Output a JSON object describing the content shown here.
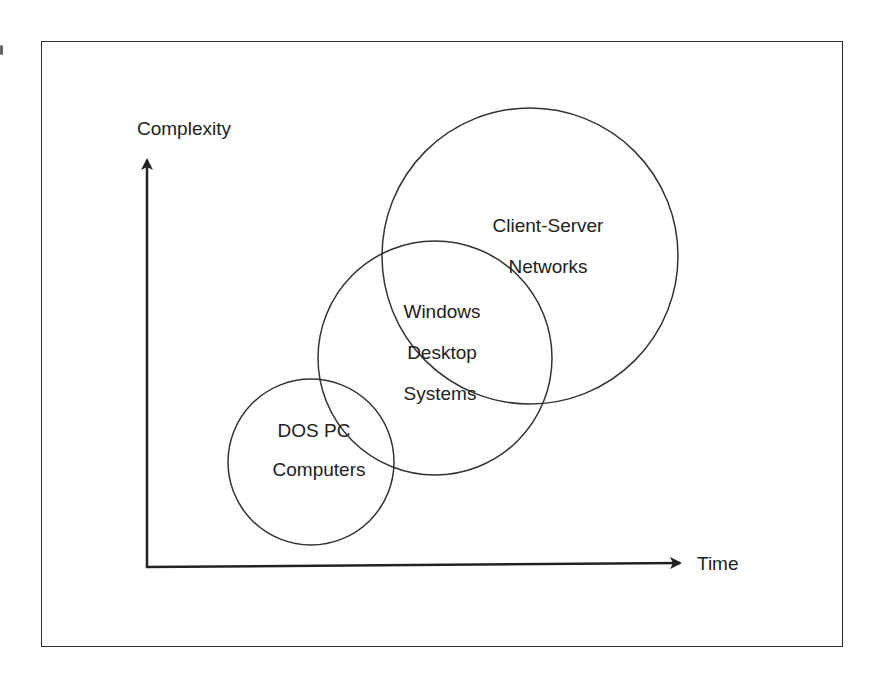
{
  "diagram": {
    "type": "venn-timeline",
    "axes": {
      "y_label": "Complexity",
      "x_label": "Time"
    },
    "circles": [
      {
        "id": "dos",
        "lines": [
          "DOS PC",
          "Computers"
        ],
        "cx": 311,
        "cy": 462,
        "r": 83
      },
      {
        "id": "windows",
        "lines": [
          "Windows",
          "Desktop",
          "Systems"
        ],
        "cx": 435,
        "cy": 358,
        "r": 117
      },
      {
        "id": "client-server",
        "lines": [
          "Client-Server",
          "Networks"
        ],
        "cx": 530,
        "cy": 256,
        "r": 148
      }
    ],
    "colors": {
      "stroke": "#333333",
      "text": "#222222",
      "background": "#ffffff"
    }
  }
}
